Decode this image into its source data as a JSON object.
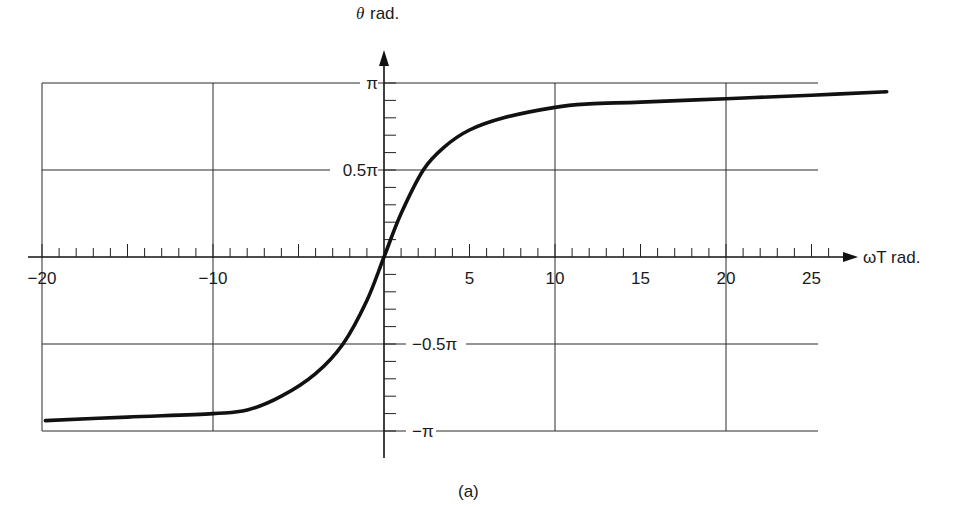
{
  "chart_data": {
    "type": "line",
    "title": "",
    "caption": "(a)",
    "xlabel": "ωT rad.",
    "ylabel_symbol": "θ",
    "ylabel_unit": "rad.",
    "xlim": [
      -20,
      26.5
    ],
    "ylim": [
      -3.14159,
      3.14159
    ],
    "grid": true,
    "x_tick_labels": [
      "−20",
      "−10",
      "5",
      "10",
      "15",
      "20",
      "25"
    ],
    "x_tick_values": [
      -20,
      -10,
      5,
      10,
      15,
      20,
      25
    ],
    "y_tick_labels": [
      "π",
      "0.5π",
      "−0.5π",
      "−π"
    ],
    "y_tick_values_in_pi": [
      1,
      0.5,
      -0.5,
      -1
    ],
    "x_gridlines": [
      -20,
      -10,
      10,
      20
    ],
    "y_gridlines_in_pi": [
      1,
      0.5,
      -0.5,
      -1
    ],
    "series": [
      {
        "name": "θ vs ωT",
        "x": [
          -19.8,
          -15,
          -10,
          -8,
          -6,
          -4,
          -2.4,
          -1,
          0,
          1,
          2.3,
          3.5,
          5,
          7,
          10,
          12,
          15,
          20,
          25,
          29.4
        ],
        "y_in_pi": [
          -0.94,
          -0.92,
          -0.9,
          -0.88,
          -0.8,
          -0.67,
          -0.5,
          -0.25,
          0,
          0.25,
          0.5,
          0.63,
          0.73,
          0.8,
          0.86,
          0.88,
          0.89,
          0.91,
          0.93,
          0.95
        ]
      }
    ]
  }
}
